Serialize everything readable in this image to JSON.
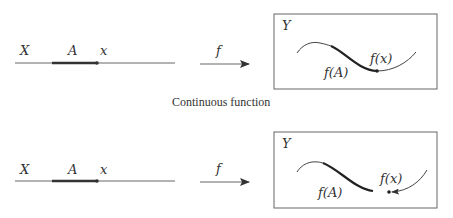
{
  "caption": "Continuous function",
  "colors": {
    "ink": "#333333",
    "thin_line": "#555555",
    "box_border": "#666666",
    "background": "#ffffff"
  },
  "panels": [
    {
      "domain_label": "X",
      "subset_label": "A",
      "point_label": "x",
      "map_label": "f",
      "codomain_label": "Y",
      "image_label": "f(A)",
      "image_point_label": "f(x)",
      "continuous": true
    },
    {
      "domain_label": "X",
      "subset_label": "A",
      "point_label": "x",
      "map_label": "f",
      "codomain_label": "Y",
      "image_label": "f(A)",
      "image_point_label": "f(x)",
      "continuous": false
    }
  ]
}
